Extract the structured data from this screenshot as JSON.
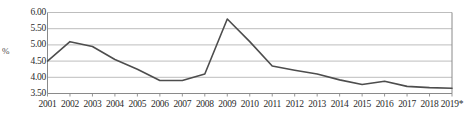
{
  "chart_data": {
    "type": "line",
    "title": "",
    "xlabel": "",
    "ylabel": "%",
    "categories": [
      "2001",
      "2002",
      "2003",
      "2004",
      "2005",
      "2006",
      "2007",
      "2008",
      "2009",
      "2010",
      "2011",
      "2012",
      "2013",
      "2014",
      "2015",
      "2016",
      "2017",
      "2018",
      "2019*"
    ],
    "values": [
      4.5,
      5.1,
      4.95,
      4.55,
      4.25,
      3.9,
      3.9,
      4.1,
      5.8,
      5.1,
      4.35,
      4.22,
      4.1,
      3.92,
      3.78,
      3.88,
      3.72,
      3.68,
      3.66
    ],
    "series": [
      {
        "name": "",
        "values": [
          4.5,
          5.1,
          4.95,
          4.55,
          4.25,
          3.9,
          3.9,
          4.1,
          5.8,
          5.1,
          4.35,
          4.22,
          4.1,
          3.92,
          3.78,
          3.88,
          3.72,
          3.68,
          3.66
        ]
      }
    ],
    "ylim": [
      3.5,
      6.0
    ],
    "ytick_values": [
      3.5,
      4.0,
      4.5,
      5.0,
      5.5,
      6.0
    ],
    "ytick_labels": [
      "3.50",
      "4.00",
      "4.50",
      "5.00",
      "5.50",
      "6.00"
    ],
    "grid": true,
    "grid_axis": "y",
    "legend": "none",
    "line_color": "#4d4d4d",
    "grid_color": "#b5b5b5",
    "axis_color": "#8a8a8a",
    "text_color": "#2b2b2b",
    "background": "#ffffff"
  }
}
